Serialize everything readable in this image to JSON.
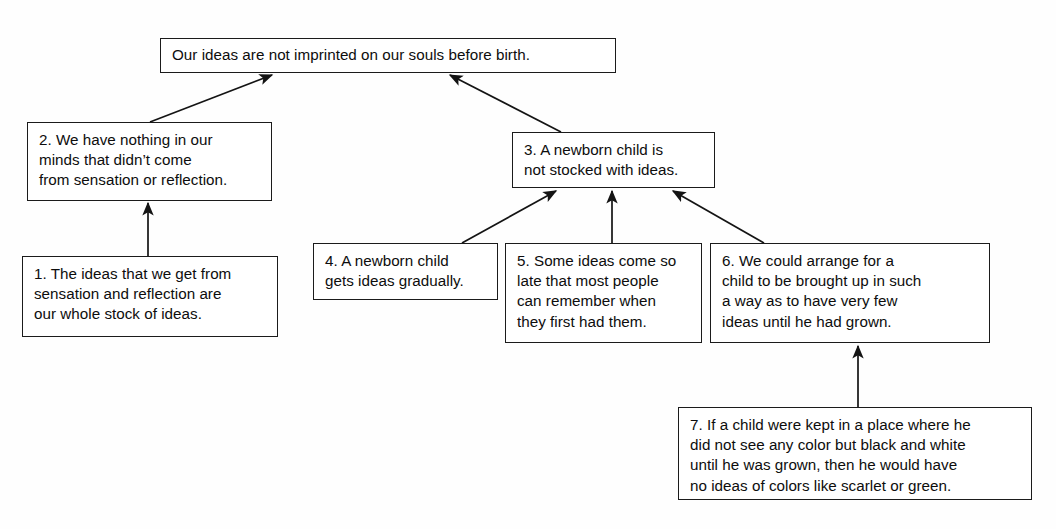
{
  "page": {
    "cut_off_header_text": "",
    "background_color": "#fefefe",
    "line_color": "#1b1b1b",
    "text_color": "#0d0d0d"
  },
  "diagram": {
    "type": "argument-map",
    "nodes": [
      {
        "id": "conclusion",
        "label": "Our ideas are not imprinted on our souls before birth.",
        "number": "",
        "x": 160,
        "y": 38,
        "w": 456,
        "h": 35
      },
      {
        "id": "premise-2",
        "label": "2. We have nothing in our\nminds that didn’t come\nfrom sensation or reflection.",
        "number": "2",
        "x": 27,
        "y": 122,
        "w": 245,
        "h": 79
      },
      {
        "id": "premise-3",
        "label": "3. A newborn child is\nnot stocked with ideas.",
        "number": "3",
        "x": 512,
        "y": 132,
        "w": 203,
        "h": 56
      },
      {
        "id": "premise-1",
        "label": "1. The ideas that we get from\nsensation and reflection are\nour whole stock of ideas.",
        "number": "1",
        "x": 22,
        "y": 256,
        "w": 256,
        "h": 81
      },
      {
        "id": "premise-4",
        "label": "4. A newborn child\ngets ideas gradually.",
        "number": "4",
        "x": 313,
        "y": 243,
        "w": 185,
        "h": 57
      },
      {
        "id": "premise-5",
        "label": "5. Some ideas come so\nlate that most people\ncan remember when\nthey first had them.",
        "number": "5",
        "x": 505,
        "y": 243,
        "w": 197,
        "h": 100
      },
      {
        "id": "premise-6",
        "label": "6. We could arrange for a\nchild to be brought up in such\na way as to have very few\nideas until he had grown.",
        "number": "6",
        "x": 710,
        "y": 243,
        "w": 280,
        "h": 100
      },
      {
        "id": "premise-7",
        "label": "7. If a child were kept in a place where he\ndid not see any color but black and white\nuntil he was grown, then he would have\nno ideas of colors like scarlet or green.",
        "number": "7",
        "x": 678,
        "y": 407,
        "w": 354,
        "h": 93
      }
    ],
    "edges": [
      {
        "id": "e-2-to-conclusion",
        "from": "premise-2",
        "to": "conclusion",
        "x1": 150,
        "y1": 122,
        "x2": 272,
        "y2": 75
      },
      {
        "id": "e-3-to-conclusion",
        "from": "premise-3",
        "to": "conclusion",
        "x1": 561,
        "y1": 132,
        "x2": 450,
        "y2": 75
      },
      {
        "id": "e-1-to-2",
        "from": "premise-1",
        "to": "premise-2",
        "x1": 148,
        "y1": 256,
        "x2": 148,
        "y2": 203
      },
      {
        "id": "e-4-to-3",
        "from": "premise-4",
        "to": "premise-3",
        "x1": 462,
        "y1": 243,
        "x2": 556,
        "y2": 191
      },
      {
        "id": "e-5-to-3",
        "from": "premise-5",
        "to": "premise-3",
        "x1": 612,
        "y1": 243,
        "x2": 612,
        "y2": 191
      },
      {
        "id": "e-6-to-3",
        "from": "premise-6",
        "to": "premise-3",
        "x1": 764,
        "y1": 243,
        "x2": 673,
        "y2": 191
      },
      {
        "id": "e-7-to-6",
        "from": "premise-7",
        "to": "premise-6",
        "x1": 858,
        "y1": 407,
        "x2": 858,
        "y2": 346
      }
    ]
  }
}
